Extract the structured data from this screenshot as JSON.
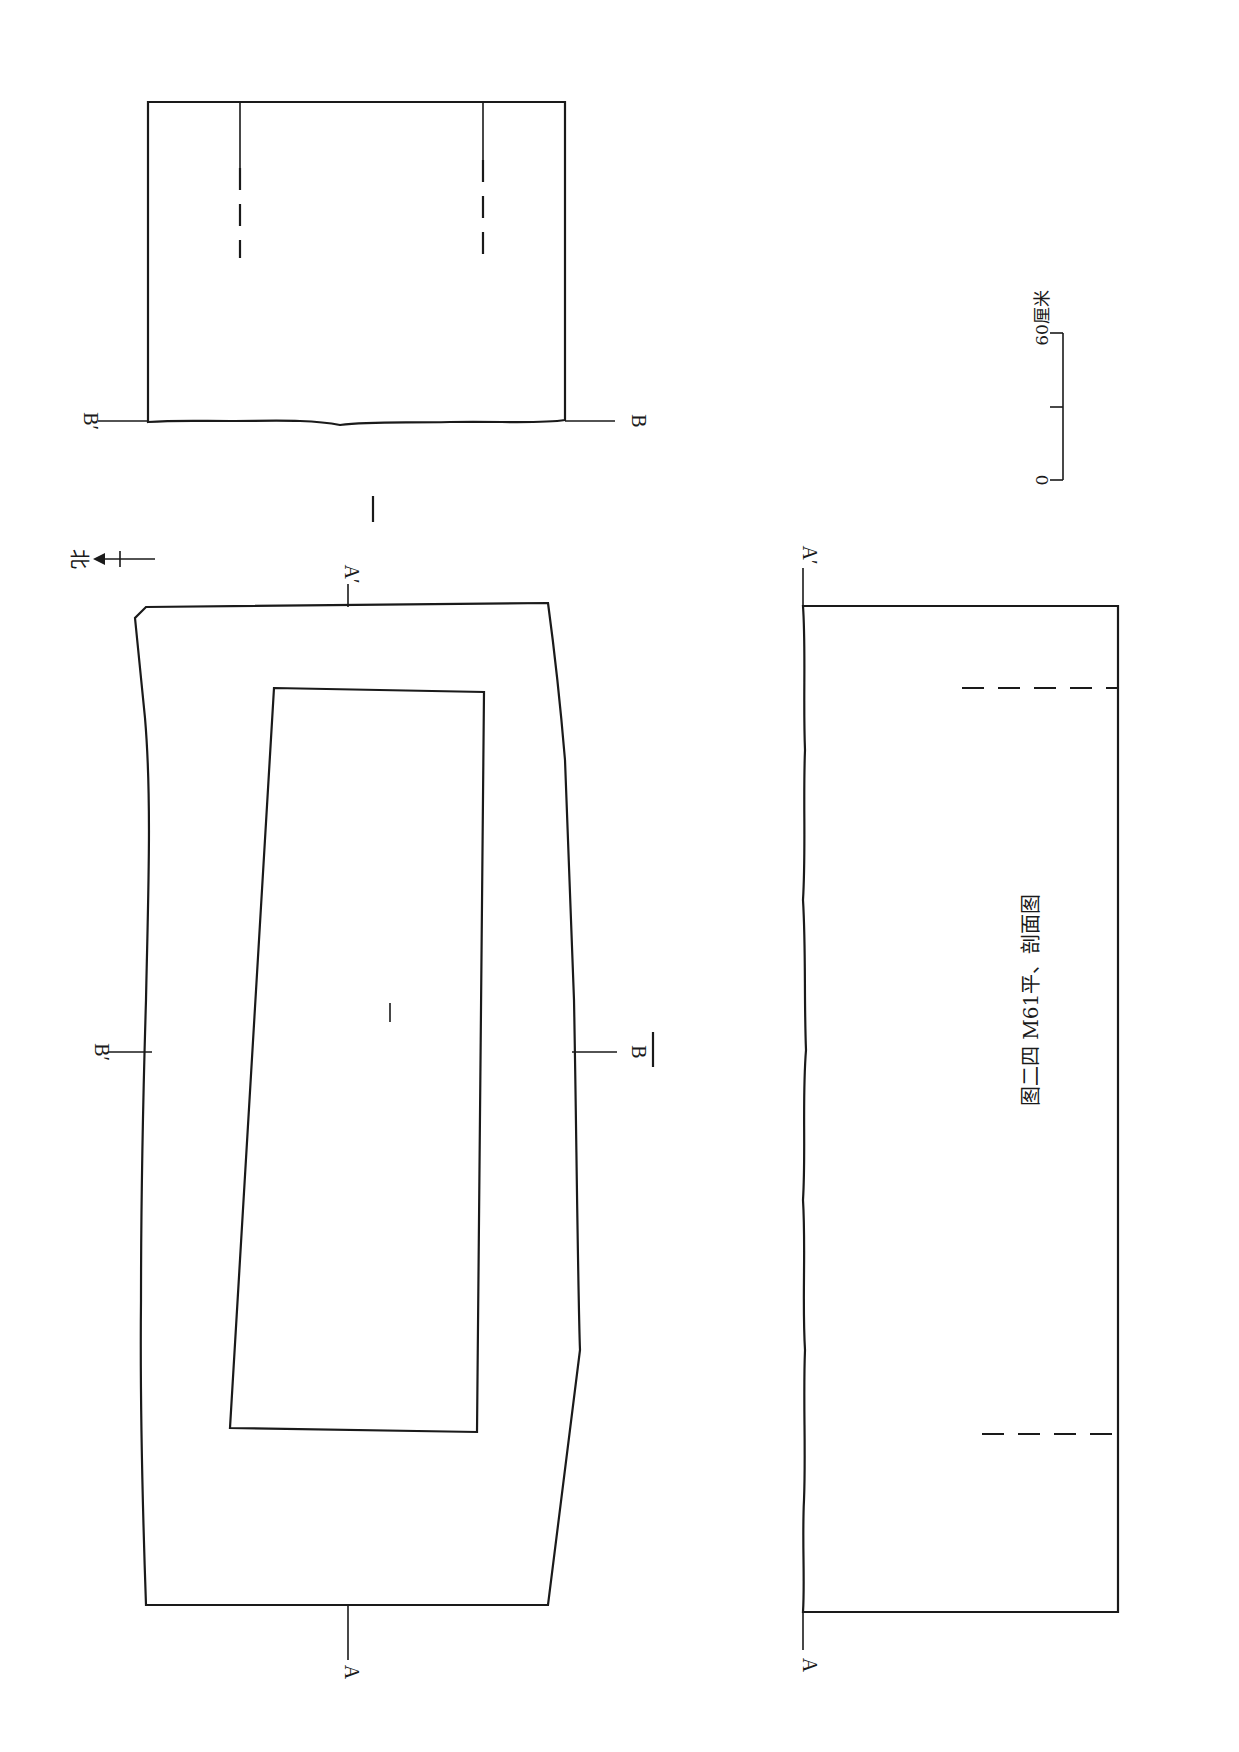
{
  "figure": {
    "caption": "图二四  M61平、剖面图",
    "orientation": "rotated 90° clockwise on page",
    "north_label": "北",
    "section_labels": {
      "a": "A",
      "a_prime": "A′",
      "b": "B",
      "b_prime": "B′"
    },
    "scale_bar": {
      "start_label": "0",
      "end_label": "60厘米"
    },
    "views": [
      {
        "name": "plan-view",
        "label": "Plan"
      },
      {
        "name": "section-a-a",
        "label": "Section A–A′"
      },
      {
        "name": "section-b-b",
        "label": "Section B–B′"
      }
    ]
  }
}
